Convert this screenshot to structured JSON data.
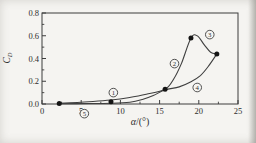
{
  "page": {
    "background": "#f5f4f1"
  },
  "chart_data": {
    "type": "line",
    "title": "",
    "xlabel_alpha": "α",
    "xlabel_rest": "/(°)",
    "ylabel_main": "C",
    "ylabel_sub": "D",
    "xlim": [
      0,
      25
    ],
    "ylim": [
      0,
      0.8
    ],
    "x_major_ticks": [
      0,
      5,
      10,
      15,
      20,
      25
    ],
    "x_tick_labels": [
      "0",
      "5",
      "10",
      "15",
      "20",
      "25"
    ],
    "x_minor_ticks": [
      2.5,
      7.5,
      12.5,
      17.5,
      22.5
    ],
    "y_major_ticks": [
      0,
      0.2,
      0.4,
      0.6,
      0.8
    ],
    "y_tick_labels": [
      "0.0",
      "0.2",
      "0.4",
      "0.6",
      "0.8"
    ],
    "y_minor_ticks": [
      0.1,
      0.3,
      0.5,
      0.7
    ],
    "grid": false,
    "legend": "none",
    "series": [
      {
        "name": "increasing-alpha-branch",
        "points": [
          [
            2.2,
            0.005
          ],
          [
            4.5,
            0.013
          ],
          [
            6.5,
            0.022
          ],
          [
            8.8,
            0.035
          ],
          [
            11,
            0.055
          ],
          [
            13.3,
            0.085
          ],
          [
            15.7,
            0.13
          ],
          [
            16.8,
            0.22
          ],
          [
            17.8,
            0.36
          ],
          [
            19,
            0.58
          ],
          [
            19.8,
            0.6
          ],
          [
            20.7,
            0.52
          ],
          [
            21.5,
            0.455
          ],
          [
            22.3,
            0.44
          ]
        ]
      },
      {
        "name": "decreasing-alpha-branch",
        "points": [
          [
            22.3,
            0.44
          ],
          [
            21.2,
            0.33
          ],
          [
            20.2,
            0.25
          ],
          [
            19,
            0.195
          ],
          [
            17.5,
            0.15
          ],
          [
            15.7,
            0.125
          ],
          [
            14.2,
            0.075
          ],
          [
            12.8,
            0.04
          ],
          [
            11.2,
            0.015
          ],
          [
            9,
            0.006
          ],
          [
            6,
            0.004
          ],
          [
            2.2,
            0.003
          ]
        ]
      }
    ],
    "markers": [
      [
        2.2,
        0.005
      ],
      [
        8.8,
        0.02
      ],
      [
        15.7,
        0.13
      ],
      [
        19,
        0.58
      ],
      [
        22.3,
        0.44
      ]
    ],
    "segment_labels": [
      {
        "text": "1",
        "x": 9.1,
        "y": 0.1
      },
      {
        "text": "2",
        "x": 16.9,
        "y": 0.355
      },
      {
        "text": "3",
        "x": 21.4,
        "y": 0.61
      },
      {
        "text": "4",
        "x": 19.8,
        "y": 0.145
      },
      {
        "text": "5",
        "x": 5.4,
        "y": -0.085
      }
    ],
    "colors": {
      "line": "#3f3f3f",
      "marker": "#141414",
      "axis": "#3c3c3c",
      "text": "#2e2e2e",
      "plot_background": "#f5f4f1"
    }
  }
}
